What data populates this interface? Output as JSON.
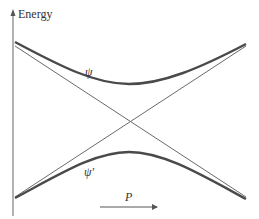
{
  "diagram": {
    "y_axis_label": "Energy",
    "x_axis_label": "P",
    "curves": [
      {
        "name": "upper-curve",
        "label": "ψ"
      },
      {
        "name": "lower-curve",
        "label": "ψ′"
      }
    ],
    "crossing_lines": 2,
    "colors": {
      "curve": "#4a4a4a",
      "line": "#6a6a6a",
      "axis": "#555555",
      "text": "#333333"
    }
  }
}
